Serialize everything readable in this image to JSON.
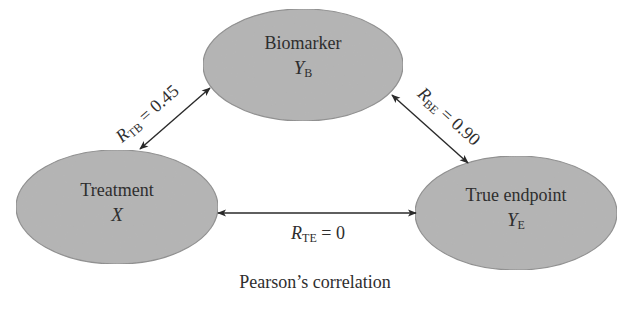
{
  "diagram": {
    "caption": "Pearson’s correlation",
    "colors": {
      "node_fill": "#b4b4b4",
      "node_stroke": "#8c8c8c",
      "arrow": "#2a2a2a",
      "text": "#2e2e2e",
      "background": "#ffffff"
    },
    "nodes": {
      "biomarker": {
        "title": "Biomarker",
        "var": "Y",
        "sub": "B"
      },
      "treatment": {
        "title": "Treatment",
        "var": "X",
        "sub": ""
      },
      "endpoint": {
        "title": "True endpoint",
        "var": "Y",
        "sub": "E"
      }
    },
    "edges": {
      "tb": {
        "symbol": "R",
        "sub": "TB",
        "value": " = 0.45",
        "from": "treatment",
        "to": "biomarker",
        "bidirectional": true
      },
      "be": {
        "symbol": "R",
        "sub": "BE",
        "value": " = 0.90",
        "from": "biomarker",
        "to": "endpoint",
        "bidirectional": true
      },
      "te": {
        "symbol": "R",
        "sub": "TE",
        "value": " = 0",
        "from": "treatment",
        "to": "endpoint",
        "bidirectional": true
      }
    }
  }
}
